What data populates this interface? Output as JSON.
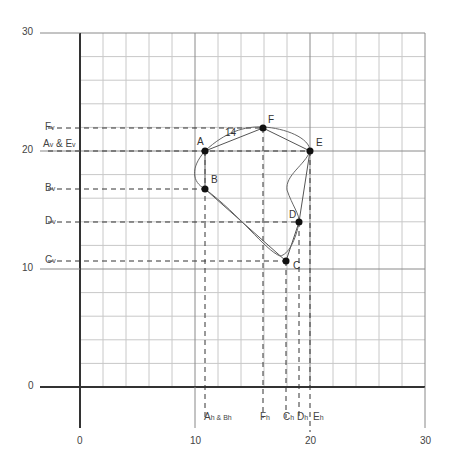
{
  "chart_data": {
    "type": "scatter",
    "title": "",
    "xlabel": "",
    "ylabel": "",
    "xlim": [
      0,
      30
    ],
    "ylim": [
      0,
      30
    ],
    "grid": true,
    "grid_step": 2,
    "x_ticks": [
      "0",
      "10",
      "20",
      "30"
    ],
    "y_ticks": [
      "0",
      "10",
      "20",
      "30"
    ],
    "points": [
      {
        "name": "A",
        "x": 11,
        "y": 20
      },
      {
        "name": "B",
        "x": 11,
        "y": 17
      },
      {
        "name": "C",
        "x": 18,
        "y": 11
      },
      {
        "name": "D",
        "x": 19,
        "y": 14
      },
      {
        "name": "E",
        "x": 20,
        "y": 20
      },
      {
        "name": "F",
        "x": 16,
        "y": 22
      }
    ],
    "polygon_order": [
      "A",
      "F",
      "E",
      "D",
      "C",
      "B"
    ],
    "annotations": [
      "14"
    ],
    "y_projection_labels": [
      {
        "text": "F",
        "sub": "v",
        "y": 22
      },
      {
        "text": "A",
        "sub": "v",
        "mid": " & E",
        "sub2": "v",
        "y": 20
      },
      {
        "text": "B",
        "sub": "v",
        "y": 17
      },
      {
        "text": "D",
        "sub": "v",
        "y": 14
      },
      {
        "text": "C",
        "sub": "v",
        "y": 11
      }
    ],
    "x_projection_labels": [
      {
        "text": "A",
        "sub": "h",
        "mid": " & B",
        "sub2": "h",
        "x": 11
      },
      {
        "text": "F",
        "sub": "h",
        "x": 16
      },
      {
        "text": "C",
        "sub": "h",
        "x": 18
      },
      {
        "text": "D",
        "sub": "h",
        "x": 19
      },
      {
        "text": "E",
        "sub": "h",
        "x": 20
      }
    ]
  },
  "labels": {
    "ticks": {
      "x0": "0",
      "x10": "10",
      "x20": "20",
      "x30": "30",
      "y0": "0",
      "y10": "10",
      "y20": "20",
      "y30": "30"
    },
    "points": {
      "A": "A",
      "B": "B",
      "C": "C",
      "D": "D",
      "E": "E",
      "F": "F"
    },
    "curve_annotation": "14",
    "yproj": {
      "F": "F",
      "F_sub": "v",
      "AE_a": "A",
      "AE_a_sub": "v",
      "AE_mid": " & E",
      "AE_e_sub": "v",
      "B": "B",
      "B_sub": "v",
      "D": "D",
      "D_sub": "v",
      "C": "C",
      "C_sub": "v"
    },
    "xproj": {
      "AB_a": "A",
      "AB_a_sub": "h",
      "AB_mid": " & B",
      "AB_b_sub": "h",
      "F": "F",
      "F_sub": "h",
      "C": "C",
      "C_sub": "h",
      "D": "D",
      "D_sub": "h",
      "E": "E",
      "E_sub": "h"
    }
  }
}
